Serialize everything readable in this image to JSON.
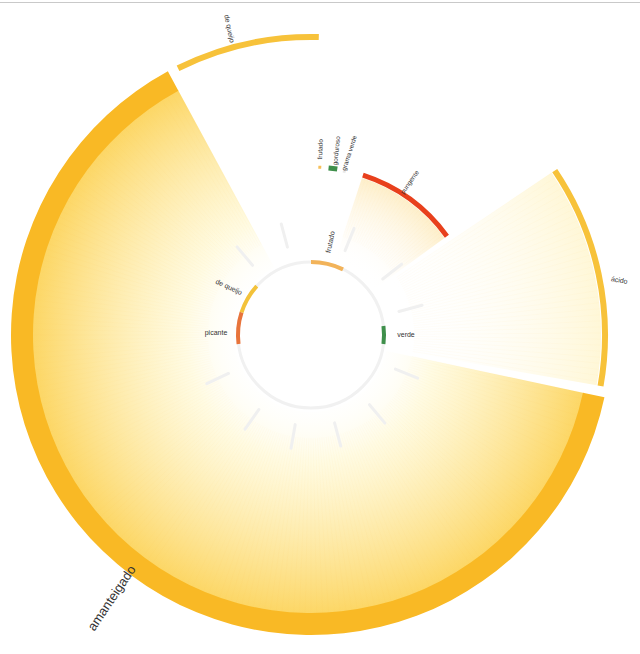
{
  "diagram": {
    "center": [
      311,
      335
    ],
    "inner_ring": {
      "radius": 73,
      "stroke": "#f1f1f1",
      "segments": [
        {
          "label": "frutado",
          "start": 0,
          "end": 26,
          "color": "#f2b35a",
          "label_angle": 12,
          "label_rotate": -78
        },
        {
          "label": "verde",
          "start": 83,
          "end": 97,
          "color": "#3f8f4b",
          "label_angle": 90,
          "label_rotate": 0
        },
        {
          "label": "picante",
          "start": 263,
          "end": 288,
          "color": "#e8743b",
          "label_angle": 271,
          "label_rotate": 0
        },
        {
          "label": "de queijo",
          "start": 288,
          "end": 312,
          "color": "#f3c23a",
          "label_angle": 300,
          "label_rotate": 25
        }
      ],
      "spokes": [
        22,
        52,
        75,
        112,
        140,
        165,
        190,
        215,
        245,
        320,
        345
      ]
    },
    "mid_ring": {
      "radius": 168,
      "segments": [
        {
          "label": "frutado",
          "start": 2.5,
          "end": 3.5,
          "color": "#f6c05a",
          "label_angle": 3,
          "label_rotate": -88
        },
        {
          "label": "gorduroso",
          "start": 6,
          "end": 9,
          "color": "#3f8f4b",
          "label_angle": 8,
          "label_rotate": -84
        },
        {
          "label": "grama verde",
          "start": 11,
          "end": 12,
          "color": "#e8e8e8",
          "label_angle": 12,
          "label_rotate": -72
        },
        {
          "label": "pungente",
          "start": 18,
          "end": 54,
          "color": "#e8401c",
          "label_angle": 33,
          "label_rotate": -55
        }
      ]
    },
    "outer_ring": {
      "segments": [
        {
          "label": "ácido",
          "start": 56,
          "end": 100,
          "color": "#f7c23a",
          "r_in": 291,
          "r_out": 297,
          "label_angle": 80,
          "label_rotate": 10,
          "label_size": 7
        },
        {
          "label": "amanteigado",
          "start": 102,
          "end": 331.5,
          "color": "#f9b925",
          "r_in": 278,
          "r_out": 300,
          "label_angle": 217,
          "label_rotate": -56,
          "label_size": 13
        },
        {
          "label": "de queijo",
          "start": 333.5,
          "end": 1.5,
          "color": "#f7c23a",
          "r_in": 295,
          "r_out": 301,
          "label_angle": 345,
          "label_rotate": 78,
          "label_size": 7
        }
      ]
    },
    "wedges": [
      {
        "from": "amanteigado",
        "start": 102,
        "end": 331.5,
        "color": "#fbd24a",
        "opacity": 0.55
      },
      {
        "from": "ácido",
        "start": 56,
        "end": 100,
        "color": "#fff3c0",
        "opacity": 0.5
      },
      {
        "from": "pungente",
        "start": 18,
        "end": 54,
        "color": "#fde8b0",
        "opacity": 0.45
      }
    ]
  }
}
